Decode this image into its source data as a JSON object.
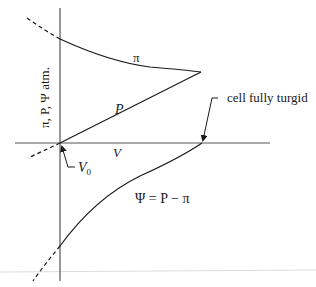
{
  "diagram": {
    "y_axis_label": "π, P, Ψ atm.",
    "x_axis_label": "V",
    "origin_label": "V",
    "origin_subscript": "0",
    "curves": {
      "pi": {
        "label": "π"
      },
      "pressure": {
        "label": "P"
      },
      "psi": {
        "label": "Ψ = P − π"
      }
    },
    "annotation": "cell fully turgid",
    "colors": {
      "line": "#1a1a1a",
      "axis": "#333333",
      "baseline": "#d9d9d9"
    }
  }
}
